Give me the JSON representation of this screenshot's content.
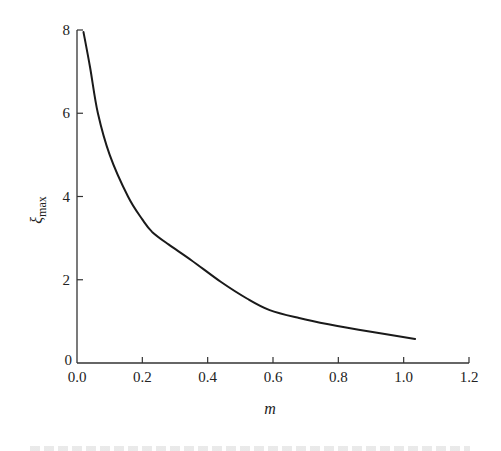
{
  "chart_data": {
    "type": "line",
    "title": "",
    "xlabel": "m",
    "ylabel": "ξ_max",
    "ylabel_main": "ξ",
    "ylabel_sub": "max",
    "xlim": [
      0.0,
      1.2
    ],
    "ylim": [
      0,
      8
    ],
    "grid": false,
    "legend": null,
    "x_ticks": [
      "0.0",
      "0.2",
      "0.4",
      "0.6",
      "0.8",
      "1.0",
      "1.2"
    ],
    "y_ticks": [
      "0",
      "2",
      "4",
      "6",
      "8"
    ],
    "series": [
      {
        "name": "ξ_max vs m",
        "color": "#1a1a1a",
        "x": [
          0.02,
          0.04,
          0.064,
          0.1,
          0.156,
          0.2,
          0.23,
          0.28,
          0.35,
          0.44,
          0.52,
          0.59,
          0.68,
          0.77,
          0.9,
          1.035
        ],
        "y": [
          7.95,
          7.1,
          6.0,
          5.0,
          4.0,
          3.45,
          3.15,
          2.85,
          2.47,
          1.95,
          1.55,
          1.27,
          1.08,
          0.93,
          0.75,
          0.58
        ]
      }
    ]
  }
}
